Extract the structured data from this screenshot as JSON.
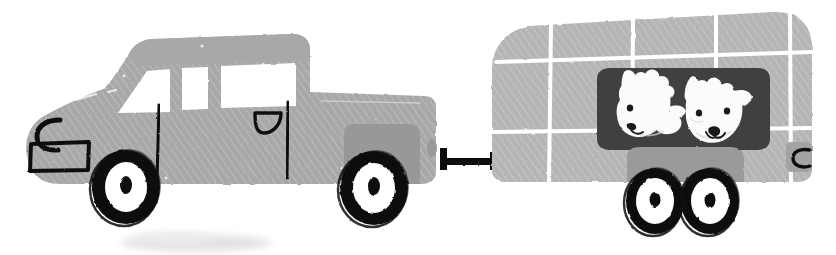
{
  "illustration": {
    "title": "Pickup truck towing a livestock trailer with two sheep",
    "style": "hand-drawn children's book illustration, grayscale",
    "background_color": "#ffffff",
    "canvas": {
      "width": 836,
      "height": 255
    }
  },
  "palette": {
    "truck_body": "#a8a8a8",
    "truck_body_dark": "#9a9a9a",
    "trailer_body": "#b5b5b5",
    "trailer_body_alt": "#ababab",
    "trailer_fender": "#9a9a9a",
    "window_dark": "#3f3f3f",
    "glass_white": "#ffffff",
    "outline_black": "#111111",
    "sheep_white": "#fbfbfb",
    "sheep_shade": "#d8d8d8",
    "shadow_gray": "#e2e2e2",
    "panel_line": "#ffffff"
  },
  "objects": {
    "truck": {
      "name": "pickup-truck",
      "label": "Pickup truck",
      "parts": [
        {
          "name": "cab-roof",
          "label": "Cab roof"
        },
        {
          "name": "windshield",
          "label": "Windshield"
        },
        {
          "name": "middle-window",
          "label": "Middle side window"
        },
        {
          "name": "rear-window",
          "label": "Rear side window"
        },
        {
          "name": "hood",
          "label": "Hood"
        },
        {
          "name": "headlight",
          "label": "Headlight"
        },
        {
          "name": "bumper",
          "label": "Front bumper"
        },
        {
          "name": "door-handle",
          "label": "Door handle"
        },
        {
          "name": "door-seam",
          "label": "Door seam line"
        },
        {
          "name": "cargo-bed",
          "label": "Cargo bed"
        },
        {
          "name": "rear-wheel-arch",
          "label": "Rear wheel arch"
        },
        {
          "name": "front-wheel",
          "label": "Front wheel"
        },
        {
          "name": "rear-wheel",
          "label": "Rear wheel"
        }
      ]
    },
    "hitch": {
      "name": "tow-hitch",
      "label": "Tow hitch bar",
      "color": "#111111"
    },
    "trailer": {
      "name": "livestock-trailer",
      "label": "Livestock trailer",
      "panel_rows": 3,
      "panel_columns": 4,
      "parts": [
        {
          "name": "trailer-shell",
          "label": "Trailer shell"
        },
        {
          "name": "panel-grid",
          "label": "Panel seam grid"
        },
        {
          "name": "animal-window",
          "label": "Dark animal window"
        },
        {
          "name": "rear-latch",
          "label": "Rear latch handle"
        },
        {
          "name": "trailer-fender",
          "label": "Wheel fender"
        },
        {
          "name": "trailer-wheel-front",
          "label": "Front trailer wheel"
        },
        {
          "name": "trailer-wheel-rear",
          "label": "Rear trailer wheel"
        }
      ]
    },
    "sheep": [
      {
        "name": "sheep-left",
        "label": "Left sheep",
        "pose": "head tilted left, one visible eye",
        "features": [
          "fluffy-topknot",
          "ear",
          "eye",
          "nose",
          "smile"
        ]
      },
      {
        "name": "sheep-right",
        "label": "Right sheep",
        "pose": "facing forward, two ears, two eyes",
        "features": [
          "two-ears",
          "two-eyes",
          "nose",
          "smile"
        ]
      }
    ],
    "ground_shadow": {
      "name": "ground-shadow",
      "label": "Faint ground shadow"
    }
  }
}
